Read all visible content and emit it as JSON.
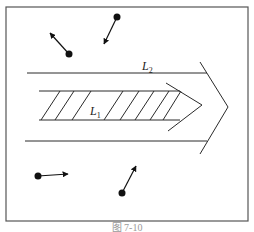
{
  "figure": {
    "caption": "图 7-10",
    "colors": {
      "line": "#2a2a2a",
      "frame": "#555555",
      "particle": "#111111",
      "caption": "#9a9a9a"
    },
    "frame": {
      "x": 6,
      "y": 7,
      "width": 242,
      "height": 214
    },
    "outer_arrow": {
      "label": "L",
      "subscript": "2",
      "top_line": {
        "x1": 27,
        "y1": 73,
        "x2": 207,
        "y2": 73
      },
      "bottom_line": {
        "x1": 25,
        "y1": 141,
        "x2": 207,
        "y2": 141
      }
    },
    "inner_arrow": {
      "label": "L",
      "subscript": "1",
      "top_line": {
        "x1": 39,
        "y1": 91,
        "x2": 180,
        "y2": 91
      },
      "bottom_line": {
        "x1": 39,
        "y1": 120,
        "x2": 180,
        "y2": 120
      },
      "hatch_count": 9
    },
    "particles": [
      {
        "id": "p1",
        "dot": [
          69,
          54
        ],
        "arrow_to": [
          49,
          32
        ],
        "direction": "up-left"
      },
      {
        "id": "p2",
        "dot": [
          117,
          16
        ],
        "arrow_to": [
          103,
          45
        ],
        "direction": "down-left"
      },
      {
        "id": "p3",
        "dot": [
          38,
          176
        ],
        "arrow_to": [
          69,
          174
        ],
        "direction": "right"
      },
      {
        "id": "p4",
        "dot": [
          122,
          193
        ],
        "arrow_to": [
          137,
          165
        ],
        "direction": "up-right"
      }
    ]
  }
}
